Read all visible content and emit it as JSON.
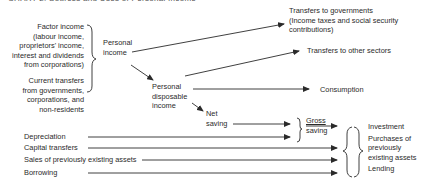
{
  "title": "CHART 2: Sources and Uses of Personal Income",
  "sources": {
    "factor_income": [
      "Factor income",
      "(labour income,",
      "proprietors' income,",
      "interest and dividends",
      "from corporations)"
    ],
    "current_transfers": [
      "Current transfers",
      "from governments,",
      "corporations, and",
      "non-residents"
    ]
  },
  "nodes": {
    "personal_income": [
      "Personal",
      "income"
    ],
    "personal_disposable_income": [
      "Personal",
      "disposable",
      "income"
    ],
    "net_saving": [
      "Net",
      "saving"
    ],
    "gross_saving": [
      "Gross",
      "saving"
    ]
  },
  "uses": {
    "transfers_to_governments": [
      "Transfers to governments",
      "(Income taxes and social security",
      "contributions)"
    ],
    "transfers_to_other_sectors": "Transfers to other sectors",
    "consumption": "Consumption"
  },
  "capital_sources": [
    "Depreciation",
    "Capital transfers",
    "Sales of previously existing assets",
    "Borrowing"
  ],
  "capital_uses": [
    "Investment",
    "Purchases of",
    "previously",
    "existing assets",
    "Lending"
  ],
  "colors": {
    "ink": "#2a2a2a",
    "background": "#ffffff"
  }
}
